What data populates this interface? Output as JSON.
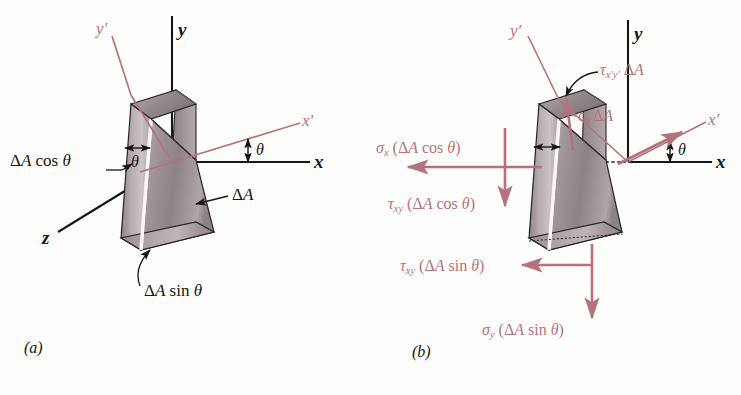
{
  "figure": {
    "type": "stress-transformation-wedge-diagram",
    "domain": "engineering-mechanics",
    "panels": [
      "a",
      "b"
    ],
    "colors": {
      "ink": "#161616",
      "rose": "#b4737b",
      "wedge_light": "#cfc7c8",
      "wedge_mid": "#a89ea1",
      "wedge_dark": "#8a7e82",
      "highlight": "#f6f2f0",
      "background": "#fdfdfc"
    }
  },
  "panel_a": {
    "tag": "(a)",
    "axes": [
      {
        "name": "y",
        "color": "ink",
        "orientation": "vertical-up"
      },
      {
        "name": "x",
        "color": "ink",
        "orientation": "horizontal-right"
      },
      {
        "name": "z",
        "color": "ink",
        "orientation": "oblique-lower-left"
      },
      {
        "name": "y'",
        "color": "rose",
        "orientation": "rotated-up-left"
      },
      {
        "name": "x'",
        "color": "rose",
        "orientation": "rotated-right-up"
      }
    ],
    "angle_labels": [
      {
        "symbol": "θ",
        "location": "between-x-and-x-prime"
      },
      {
        "symbol": "θ",
        "location": "inside-wedge-at-top-face"
      }
    ],
    "dimension_labels": [
      {
        "text_plain": "ΔA cos θ",
        "leader": "to-vertical-face",
        "color": "ink"
      },
      {
        "text_plain": "ΔA",
        "leader": "to-inclined-face",
        "color": "ink"
      },
      {
        "text_plain": "ΔA sin θ",
        "leader": "to-bottom-face",
        "color": "ink"
      }
    ]
  },
  "panel_b": {
    "tag": "(b)",
    "axes": [
      {
        "name": "y",
        "color": "ink",
        "orientation": "vertical-up"
      },
      {
        "name": "x",
        "color": "ink",
        "orientation": "horizontal-right"
      },
      {
        "name": "y'",
        "color": "rose",
        "orientation": "rotated-up-left"
      },
      {
        "name": "x'",
        "color": "rose",
        "orientation": "rotated-right-up"
      }
    ],
    "angle_labels": [
      {
        "symbol": "θ",
        "location": "between-x-and-x-prime"
      }
    ],
    "force_labels": [
      {
        "id": "tau-xprime-yprime-dA",
        "symbol": "τ",
        "subscript": "x'y'",
        "factor": "ΔA",
        "text_plain": "τx'y' ΔA",
        "arrow": "up-along-inclined-face",
        "color": "rose"
      },
      {
        "id": "sigma-xprime-dA",
        "symbol": "σ",
        "subscript": "x'",
        "factor": "ΔA",
        "text_plain": "σx' ΔA",
        "arrow": "outward-normal-to-inclined-face",
        "color": "rose"
      },
      {
        "id": "sigma-x-dA-cos-theta",
        "symbol": "σ",
        "subscript": "x",
        "factor": "(ΔA cos θ)",
        "text_plain": "σx (ΔA cos θ)",
        "arrow": "left-horizontal",
        "color": "rose"
      },
      {
        "id": "tau-xy-dA-cos-theta",
        "symbol": "τ",
        "subscript": "xy",
        "factor": "(ΔA cos θ)",
        "text_plain": "τxy (ΔA cos θ)",
        "arrow": "down-vertical",
        "color": "rose"
      },
      {
        "id": "tau-xy-dA-sin-theta",
        "symbol": "τ",
        "subscript": "xy",
        "factor": "(ΔA sin θ)",
        "text_plain": "τxy (ΔA sin θ)",
        "arrow": "left-horizontal-lower",
        "color": "rose"
      },
      {
        "id": "sigma-y-dA-sin-theta",
        "symbol": "σ",
        "subscript": "y",
        "factor": "(ΔA sin θ)",
        "text_plain": "σy (ΔA sin θ)",
        "arrow": "down-vertical-lower",
        "color": "rose"
      }
    ]
  },
  "glyphs": {
    "delta": "Δ",
    "theta": "θ",
    "sigma": "σ",
    "tau": "τ",
    "A": "A",
    "cos": "cos",
    "sin": "sin",
    "prime": "′",
    "paren_open": "(",
    "paren_close": ")",
    "space": " ",
    "x": "x",
    "y": "y",
    "z": "z",
    "xy": "xy",
    "x_prime": "x′",
    "y_prime": "y′",
    "xprime_yprime": "x′y′"
  }
}
